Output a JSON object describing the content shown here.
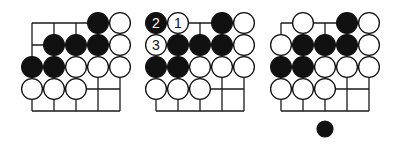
{
  "figure": {
    "colors": {
      "black_stone": "#111111",
      "white_stone": "#ffffff",
      "line": "#1a1a1a",
      "background": "#ffffff"
    },
    "spacing": 22,
    "stone_radius": 11,
    "diagrams": [
      {
        "id": "diagram-1",
        "origin": [
          32,
          23
        ],
        "cols": 5,
        "rows": 5,
        "stones": [
          {
            "row": 0,
            "col": 3,
            "color": "black",
            "label": ""
          },
          {
            "row": 0,
            "col": 4,
            "color": "white",
            "label": ""
          },
          {
            "row": 1,
            "col": 1,
            "color": "black",
            "label": ""
          },
          {
            "row": 1,
            "col": 2,
            "color": "black",
            "label": ""
          },
          {
            "row": 1,
            "col": 3,
            "color": "black",
            "label": ""
          },
          {
            "row": 1,
            "col": 4,
            "color": "white",
            "label": ""
          },
          {
            "row": 2,
            "col": 0,
            "color": "black",
            "label": ""
          },
          {
            "row": 2,
            "col": 1,
            "color": "black",
            "label": ""
          },
          {
            "row": 2,
            "col": 2,
            "color": "white",
            "label": ""
          },
          {
            "row": 2,
            "col": 3,
            "color": "white",
            "label": ""
          },
          {
            "row": 2,
            "col": 4,
            "color": "white",
            "label": ""
          },
          {
            "row": 3,
            "col": 0,
            "color": "white",
            "label": ""
          },
          {
            "row": 3,
            "col": 1,
            "color": "white",
            "label": ""
          },
          {
            "row": 3,
            "col": 2,
            "color": "white",
            "label": ""
          }
        ]
      },
      {
        "id": "diagram-2",
        "origin": [
          156,
          23
        ],
        "cols": 5,
        "rows": 5,
        "stones": [
          {
            "row": 0,
            "col": 0,
            "color": "black",
            "label": "2"
          },
          {
            "row": 0,
            "col": 1,
            "color": "white",
            "label": "1"
          },
          {
            "row": 0,
            "col": 3,
            "color": "black",
            "label": ""
          },
          {
            "row": 0,
            "col": 4,
            "color": "white",
            "label": ""
          },
          {
            "row": 1,
            "col": 0,
            "color": "white",
            "label": "3"
          },
          {
            "row": 1,
            "col": 1,
            "color": "black",
            "label": ""
          },
          {
            "row": 1,
            "col": 2,
            "color": "black",
            "label": ""
          },
          {
            "row": 1,
            "col": 3,
            "color": "black",
            "label": ""
          },
          {
            "row": 1,
            "col": 4,
            "color": "white",
            "label": ""
          },
          {
            "row": 2,
            "col": 0,
            "color": "black",
            "label": ""
          },
          {
            "row": 2,
            "col": 1,
            "color": "black",
            "label": ""
          },
          {
            "row": 2,
            "col": 2,
            "color": "white",
            "label": ""
          },
          {
            "row": 2,
            "col": 3,
            "color": "white",
            "label": ""
          },
          {
            "row": 2,
            "col": 4,
            "color": "white",
            "label": ""
          },
          {
            "row": 3,
            "col": 0,
            "color": "white",
            "label": ""
          },
          {
            "row": 3,
            "col": 1,
            "color": "white",
            "label": ""
          },
          {
            "row": 3,
            "col": 2,
            "color": "white",
            "label": ""
          }
        ]
      },
      {
        "id": "diagram-3",
        "origin": [
          281,
          23
        ],
        "cols": 5,
        "rows": 5,
        "stones": [
          {
            "row": 0,
            "col": 1,
            "color": "white",
            "label": ""
          },
          {
            "row": 0,
            "col": 3,
            "color": "black",
            "label": ""
          },
          {
            "row": 0,
            "col": 4,
            "color": "white",
            "label": ""
          },
          {
            "row": 1,
            "col": 0,
            "color": "white",
            "label": ""
          },
          {
            "row": 1,
            "col": 1,
            "color": "black",
            "label": ""
          },
          {
            "row": 1,
            "col": 2,
            "color": "black",
            "label": ""
          },
          {
            "row": 1,
            "col": 3,
            "color": "black",
            "label": ""
          },
          {
            "row": 1,
            "col": 4,
            "color": "white",
            "label": ""
          },
          {
            "row": 2,
            "col": 0,
            "color": "black",
            "label": ""
          },
          {
            "row": 2,
            "col": 1,
            "color": "black",
            "label": ""
          },
          {
            "row": 2,
            "col": 2,
            "color": "white",
            "label": ""
          },
          {
            "row": 2,
            "col": 3,
            "color": "white",
            "label": ""
          },
          {
            "row": 2,
            "col": 4,
            "color": "white",
            "label": ""
          },
          {
            "row": 3,
            "col": 0,
            "color": "white",
            "label": ""
          },
          {
            "row": 3,
            "col": 1,
            "color": "white",
            "label": ""
          },
          {
            "row": 3,
            "col": 2,
            "color": "white",
            "label": ""
          }
        ],
        "extra_stone": {
          "x": 325,
          "y": 129,
          "r": 8,
          "color": "black",
          "meaning": "move-indicator / tenuki marker"
        }
      }
    ]
  }
}
